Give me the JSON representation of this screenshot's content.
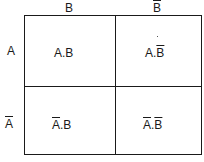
{
  "diagram": {
    "type": "karnaugh-map",
    "columns": [
      {
        "label": "B",
        "negated": false
      },
      {
        "label": "B",
        "negated": true
      }
    ],
    "rows": [
      {
        "label": "A",
        "negated": false
      },
      {
        "label": "A",
        "negated": true
      }
    ],
    "cells": [
      [
        {
          "a": "A",
          "a_neg": false,
          "sep": ".",
          "b": "B",
          "b_neg": false
        },
        {
          "a": "A",
          "a_neg": false,
          "sep": ".",
          "b": "B",
          "b_neg": true
        }
      ],
      [
        {
          "a": "A",
          "a_neg": true,
          "sep": ".",
          "b": "B",
          "b_neg": false
        },
        {
          "a": "A",
          "a_neg": true,
          "sep": ".",
          "b": "B",
          "b_neg": true
        }
      ]
    ]
  }
}
